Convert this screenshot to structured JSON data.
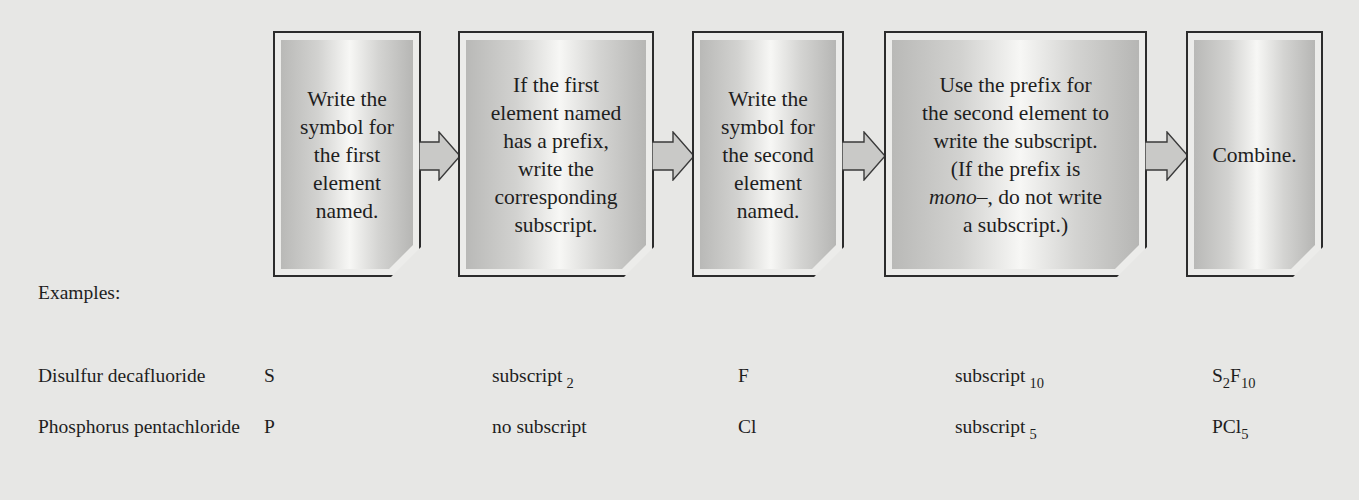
{
  "flowchart": {
    "steps": [
      {
        "id": 1,
        "text": "Write the\nsymbol for\nthe first\nelement\nnamed."
      },
      {
        "id": 2,
        "text": "If the first\nelement named\nhas a prefix,\nwrite the\ncorresponding\nsubscript."
      },
      {
        "id": 3,
        "text": "Write the\nsymbol for\nthe second\nelement\nnamed."
      },
      {
        "id": 4,
        "text_before_italic": "Use the prefix for\nthe second element to\nwrite the subscript.\n(If the prefix is\n",
        "italic": "mono",
        "text_after_italic": "–, do not write\na subscript.)"
      },
      {
        "id": 5,
        "text": "Combine."
      }
    ],
    "arrow_icon": "right-block-arrow"
  },
  "examples": {
    "label": "Examples:",
    "rows": [
      {
        "name": "Disulfur decafluoride",
        "first_symbol": "S",
        "first_subscript_text": "subscript",
        "first_subscript_value": "2",
        "second_symbol": "F",
        "second_subscript_text": "subscript",
        "second_subscript_value": "10",
        "formula_parts": [
          {
            "text": "S",
            "sub": "2"
          },
          {
            "text": "F",
            "sub": "10"
          }
        ]
      },
      {
        "name": "Phosphorus pentachloride",
        "first_symbol": "P",
        "first_subscript_text": "no subscript",
        "first_subscript_value": "",
        "second_symbol": "Cl",
        "second_subscript_text": "subscript",
        "second_subscript_value": "5",
        "formula_parts": [
          {
            "text": "PCl",
            "sub": "5"
          }
        ]
      }
    ]
  },
  "colors": {
    "background": "#e7e7e5",
    "box_border": "#2c2c2c",
    "box_highlight": "#f7f7f5",
    "box_shade": "#b6b6b4",
    "arrow_fill": "#c9c9c7",
    "text": "#1e1e1e"
  }
}
